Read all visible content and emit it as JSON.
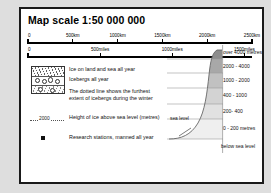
{
  "title": "Map scale  1:50 000 000",
  "scale_km": {
    "unit": "km",
    "ticks": [
      {
        "label": "0",
        "pos": 0
      },
      {
        "label": "500km",
        "pos": 20
      },
      {
        "label": "1000km",
        "pos": 40
      },
      {
        "label": "1500km",
        "pos": 60
      },
      {
        "label": "2000km",
        "pos": 80
      },
      {
        "label": "2500km",
        "pos": 100
      }
    ]
  },
  "scale_miles": {
    "unit": "miles",
    "ticks": [
      {
        "label": "0",
        "pos": 0
      },
      {
        "label": "500miles",
        "pos": 32.2
      },
      {
        "label": "1000miles",
        "pos": 64.4
      },
      {
        "label": "1500miles",
        "pos": 96.6
      }
    ]
  },
  "legend": {
    "items": [
      {
        "symbol": "ice-pattern-box",
        "label": "Ice on land and sea all year"
      },
      {
        "symbol": "iceberg-pattern",
        "label": "Icebergs all year"
      },
      {
        "symbol": "dotted-line",
        "label": "The dotted line shows the furthest extent of icebergs during the winter"
      },
      {
        "symbol": "height-contour",
        "label": "Height of ice above sea level (metres)",
        "sample_value": "2000"
      },
      {
        "symbol": "station-square",
        "label": "Research stations, manned all year"
      }
    ]
  },
  "profile": {
    "sea_level_label": "sea level",
    "bands": [
      {
        "label": "over 4000 metres",
        "color": "#8d8d8d"
      },
      {
        "label": "2000 - 4000",
        "color": "#a8a8a8"
      },
      {
        "label": "1000 - 2000",
        "color": "#c0c0c0"
      },
      {
        "label": "400 - 1000",
        "color": "#d2d2d2"
      },
      {
        "label": "200- 400",
        "color": "#e0e0e0"
      },
      {
        "label": "0 - 200 metres",
        "color": "#eeeeee"
      },
      {
        "label": "below sea level",
        "color": "#ffffff"
      }
    ]
  }
}
